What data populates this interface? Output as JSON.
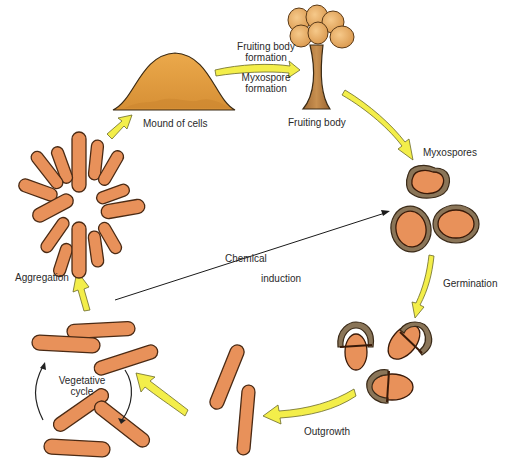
{
  "diagram": {
    "stages": [
      {
        "id": "mound",
        "label": "Mound of cells"
      },
      {
        "id": "fruiting-body",
        "label": "Fruiting body"
      },
      {
        "id": "myxospores",
        "label": "Myxospores"
      },
      {
        "id": "aggregation",
        "label": "Aggregation"
      },
      {
        "id": "vegetative",
        "label_line1": "Vegetative",
        "label_line2": "cycle"
      }
    ],
    "transitions": {
      "fruiting_formation_line1": "Fruiting body",
      "fruiting_formation_line2": "formation",
      "myxospore_formation_line1": "Myxospore",
      "myxospore_formation_line2": "formation",
      "germination": "Germination",
      "outgrowth": "Outgrowth",
      "chemical": "Chemical",
      "induction": "induction"
    },
    "colors": {
      "cell_fill": "#e8915a",
      "cell_outline": "#4a2a14",
      "arrow_fill": "#f3ee4a",
      "mound_fill": "#e9a94a",
      "stalk_fill": "#b57a3a",
      "spore_coat": "#8a7558"
    }
  }
}
